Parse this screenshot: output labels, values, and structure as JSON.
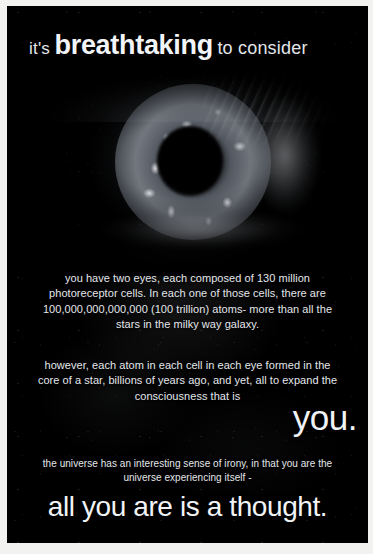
{
  "poster": {
    "kind": "inspirational-poster",
    "background_color": "#010101",
    "text_color": "#e9ebef",
    "frame_color": "#f2f2f0",
    "headline": {
      "lead": "it's",
      "emphasis": "breathtaking",
      "trail": "to consider"
    },
    "image": {
      "subject": "human-eye",
      "description": "close-up macro photograph of a human eye blended with a starfield"
    },
    "paragraphs": [
      {
        "id": "paragraph-one",
        "text": "you have two eyes, each composed of 130 million photoreceptor cells. In each one of those cells, there are 100,000,000,000,000 (100 trillion) atoms- more than all the stars in the milky way galaxy."
      },
      {
        "id": "paragraph-two",
        "text": "however, each atom in each cell in each eye formed in the core of a star, billions of years ago, and yet, all to expand the consciousness that is"
      },
      {
        "id": "paragraph-three",
        "text": "the universe has an interesting sense of irony, in that you are the universe experiencing itself -"
      }
    ],
    "you_line": "you.",
    "final_line": "all you are is a thought.",
    "facts": {
      "photoreceptor_cells": "130 million",
      "atoms_per_cell_digits": "100,000,000,000,000",
      "atoms_per_cell_words": "100 trillion",
      "eye_count": "two"
    }
  }
}
